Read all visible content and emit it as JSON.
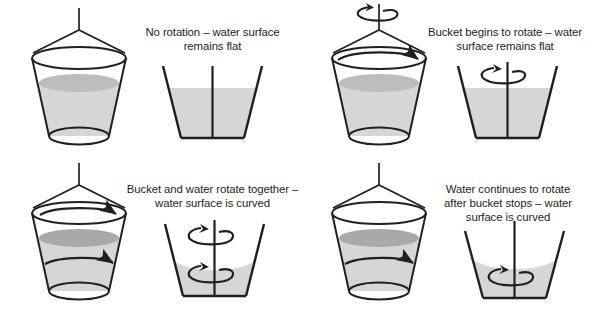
{
  "figure": {
    "background_color": "#ffffff",
    "stroke_color": "#231f20",
    "water_body_color": "#d6d6d6",
    "water_surface_color": "#a9a9a9",
    "width": 601,
    "height": 313
  },
  "panels": [
    {
      "id": "panel-1",
      "caption": "No rotation – water surface\nremains flat",
      "bucket_3d": {
        "rope": true,
        "rim_arrow": false,
        "water_arrow": false,
        "axis_spin_arrow": false,
        "surface_shape": "flat"
      },
      "cross_section": {
        "surface_shape": "flat",
        "axis_line": true,
        "spin_arrow_above": false,
        "spin_arrow_in_water": false
      }
    },
    {
      "id": "panel-2",
      "caption": "Bucket begins to rotate – water\nsurface remains flat",
      "bucket_3d": {
        "rope": true,
        "rim_arrow": true,
        "water_arrow": false,
        "axis_spin_arrow": true,
        "surface_shape": "flat"
      },
      "cross_section": {
        "surface_shape": "flat",
        "axis_line": true,
        "spin_arrow_above": true,
        "spin_arrow_in_water": false
      }
    },
    {
      "id": "panel-3",
      "caption": "Bucket and water rotate together –\nwater surface is curved",
      "bucket_3d": {
        "rope": true,
        "rim_arrow": true,
        "water_arrow": true,
        "axis_spin_arrow": false,
        "surface_shape": "curved"
      },
      "cross_section": {
        "surface_shape": "curved",
        "axis_line": true,
        "spin_arrow_above": true,
        "spin_arrow_in_water": true
      }
    },
    {
      "id": "panel-4",
      "caption": "Water continues to rotate\nafter bucket stops – water\nsurface is curved",
      "bucket_3d": {
        "rope": true,
        "rim_arrow": false,
        "water_arrow": true,
        "axis_spin_arrow": false,
        "surface_shape": "curved"
      },
      "cross_section": {
        "surface_shape": "curved",
        "axis_line": true,
        "spin_arrow_above": false,
        "spin_arrow_in_water": true
      }
    }
  ]
}
